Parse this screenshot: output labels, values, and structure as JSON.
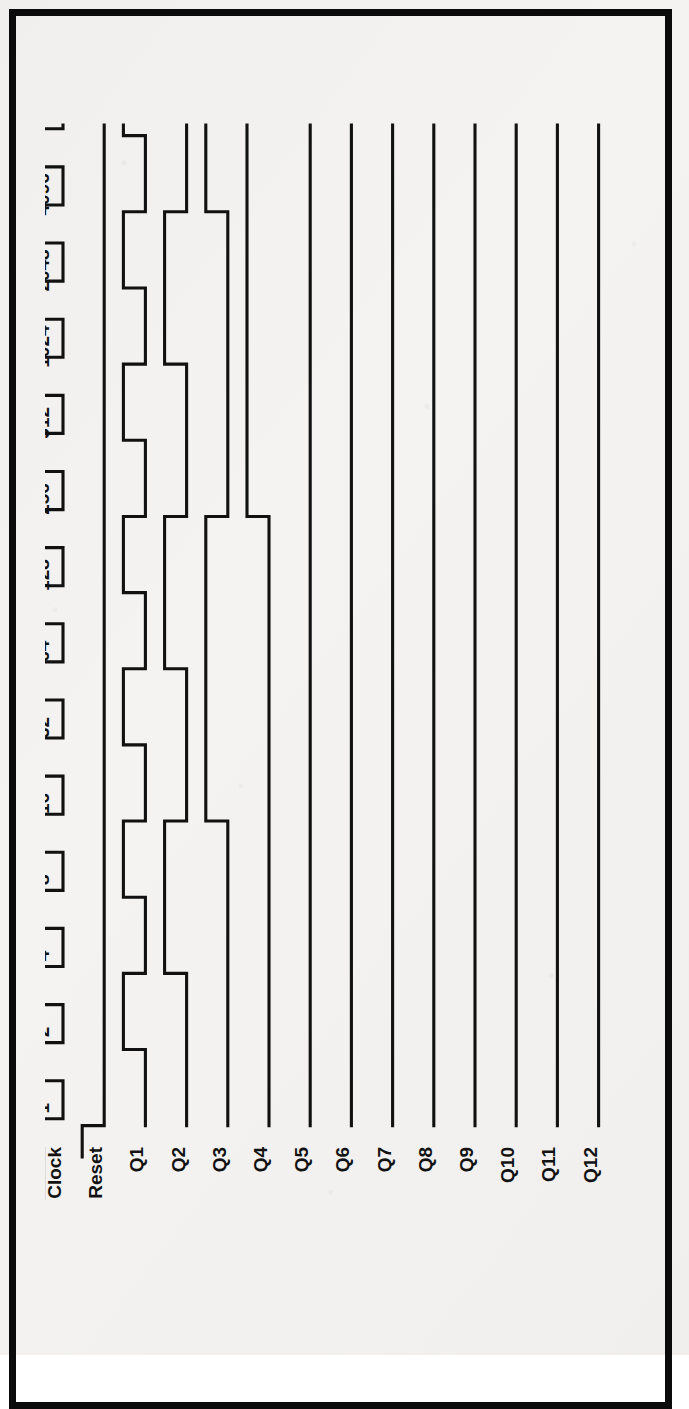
{
  "document": {
    "kind": "timing-diagram",
    "title": "12-stage binary ripple counter timing diagram",
    "border_color": "#0b0b0b",
    "trace_color": "#111111",
    "paper_color": "#f4f3f1"
  },
  "chart_data": {
    "type": "line",
    "xlabel": "",
    "ylabel": "",
    "grid": false,
    "legend_position": "left",
    "orientation": "rotated-90-ccw",
    "x_tick_labels": [
      "1",
      "2",
      "4",
      "8",
      "16",
      "32",
      "64",
      "128",
      "256",
      "512",
      "1024",
      "2048",
      "4096"
    ],
    "x_tick_values": [
      1,
      2,
      4,
      8,
      16,
      32,
      64,
      128,
      256,
      512,
      1024,
      2048,
      4096
    ],
    "xlim": [
      0,
      13
    ],
    "signal_labels": [
      "Clock",
      "Reset",
      "Q1",
      "Q2",
      "Q3",
      "Q4",
      "Q5",
      "Q6",
      "Q7",
      "Q8",
      "Q9",
      "Q10",
      "Q11",
      "Q12"
    ],
    "clock_overbar": true,
    "series": [
      {
        "name": "Clock",
        "overbar": true,
        "note": "active-low clock, square wave, 13 full periods across the 13 labelled counts",
        "values": [
          1,
          0,
          1,
          0,
          1,
          0,
          1,
          0,
          1,
          0,
          1,
          0,
          1,
          0,
          1,
          0,
          1,
          0,
          1,
          0,
          1,
          0,
          1,
          0,
          1,
          0
        ]
      },
      {
        "name": "Reset",
        "overbar": false,
        "note": "starts asserted high, falls low just before count 1 and stays low",
        "values": [
          1,
          0,
          0,
          0,
          0,
          0,
          0,
          0,
          0,
          0,
          0,
          0,
          0,
          0,
          0,
          0,
          0,
          0,
          0,
          0,
          0,
          0,
          0,
          0,
          0,
          0
        ]
      },
      {
        "name": "Q1",
        "overbar": false,
        "divide_by": 2,
        "values": [
          0,
          1,
          0,
          1,
          0,
          1,
          0,
          1,
          0,
          1,
          0,
          1,
          0,
          1,
          0,
          1,
          0,
          1,
          0,
          1,
          0,
          1,
          0,
          1,
          0,
          1
        ]
      },
      {
        "name": "Q2",
        "overbar": false,
        "divide_by": 4,
        "values": [
          0,
          0,
          1,
          1,
          0,
          0,
          1,
          1,
          0,
          0,
          1,
          1,
          0,
          0,
          1,
          1,
          0,
          0,
          1,
          1,
          0,
          0,
          1,
          1,
          0,
          0
        ]
      },
      {
        "name": "Q3",
        "overbar": false,
        "divide_by": 8,
        "values": [
          0,
          0,
          0,
          0,
          1,
          1,
          1,
          1,
          0,
          0,
          0,
          0,
          1,
          1,
          1,
          1,
          0,
          0,
          0,
          0,
          1,
          1,
          1,
          1,
          0,
          0
        ]
      },
      {
        "name": "Q4",
        "overbar": false,
        "divide_by": 16,
        "values": [
          0,
          0,
          0,
          0,
          0,
          0,
          0,
          0,
          1,
          1,
          1,
          1,
          1,
          1,
          1,
          1,
          0,
          0,
          0,
          0,
          0,
          0,
          0,
          0,
          1,
          1
        ]
      },
      {
        "name": "Q5",
        "overbar": false,
        "divide_by": 32,
        "values": [
          0,
          0,
          0,
          0,
          0,
          0,
          0,
          0,
          0,
          0,
          0,
          0,
          0,
          0,
          0,
          0,
          1,
          1,
          1,
          1,
          1,
          1,
          1,
          1,
          1,
          1
        ]
      },
      {
        "name": "Q6",
        "overbar": false,
        "divide_by": 64,
        "values": [
          0,
          0,
          0,
          0,
          0,
          0,
          0,
          0,
          0,
          0,
          0,
          0,
          0,
          0,
          0,
          0,
          0,
          0,
          0,
          0,
          0,
          0,
          0,
          0,
          0,
          0
        ]
      },
      {
        "name": "Q7",
        "overbar": false,
        "divide_by": 128,
        "values": [
          0,
          0,
          0,
          0,
          0,
          0,
          0,
          0,
          0,
          0,
          0,
          0,
          0,
          0,
          0,
          0,
          0,
          0,
          0,
          0,
          0,
          0,
          0,
          0,
          0,
          0
        ]
      },
      {
        "name": "Q8",
        "overbar": false,
        "divide_by": 256,
        "values": [
          0,
          0,
          0,
          0,
          0,
          0,
          0,
          0,
          0,
          0,
          0,
          0,
          0,
          0,
          0,
          0,
          0,
          0,
          0,
          0,
          0,
          0,
          0,
          0,
          0,
          0
        ]
      },
      {
        "name": "Q9",
        "overbar": false,
        "divide_by": 512,
        "values": [
          0,
          0,
          0,
          0,
          0,
          0,
          0,
          0,
          0,
          0,
          0,
          0,
          0,
          0,
          0,
          0,
          0,
          0,
          0,
          0,
          0,
          0,
          0,
          0,
          0,
          0
        ]
      },
      {
        "name": "Q10",
        "overbar": false,
        "divide_by": 1024,
        "values": [
          0,
          0,
          0,
          0,
          0,
          0,
          0,
          0,
          0,
          0,
          0,
          0,
          0,
          0,
          0,
          0,
          0,
          0,
          0,
          0,
          0,
          0,
          0,
          0,
          0,
          0
        ]
      },
      {
        "name": "Q11",
        "overbar": false,
        "divide_by": 2048,
        "values": [
          0,
          0,
          0,
          0,
          0,
          0,
          0,
          0,
          0,
          0,
          0,
          0,
          0,
          0,
          0,
          0,
          0,
          0,
          0,
          0,
          0,
          0,
          0,
          0,
          0,
          0
        ]
      },
      {
        "name": "Q12",
        "overbar": false,
        "divide_by": 4096,
        "values": [
          0,
          0,
          0,
          0,
          0,
          0,
          0,
          0,
          0,
          0,
          0,
          0,
          0,
          0,
          0,
          0,
          0,
          0,
          0,
          0,
          0,
          0,
          0,
          0,
          0,
          0
        ]
      }
    ]
  }
}
